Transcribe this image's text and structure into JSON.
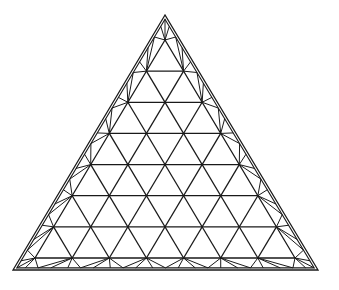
{
  "diagram": {
    "type": "triangular-space-frame",
    "subdivisions": 7,
    "colors": {
      "background": "#ffffff",
      "stroke": "#1a1a1a"
    },
    "outer_triangle": {
      "apex": [
        165,
        15
      ],
      "bottom_left": [
        13,
        270
      ],
      "bottom_right": [
        318,
        270
      ]
    },
    "inner_triangle": {
      "apex": [
        165,
        40
      ],
      "bottom_left": [
        35,
        258
      ],
      "bottom_right": [
        295,
        258
      ]
    }
  }
}
